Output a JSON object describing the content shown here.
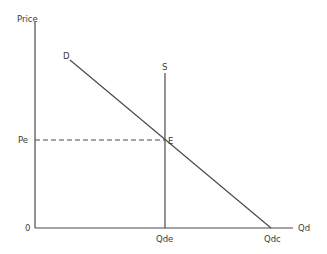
{
  "diagram": {
    "type": "supply-demand",
    "colors": {
      "line": "#4a4a4a",
      "text": "#3a3a3a",
      "background": "#ffffff"
    },
    "axes": {
      "y_label": "Price",
      "x_label": "Qd",
      "origin_label": "0"
    },
    "curves": {
      "demand_label": "D",
      "supply_label": "S"
    },
    "equilibrium": {
      "point_label": "E",
      "price_label": "Pe",
      "quantity_label": "Qde"
    },
    "intercepts": {
      "demand_x_intercept_label": "Qdc"
    }
  }
}
